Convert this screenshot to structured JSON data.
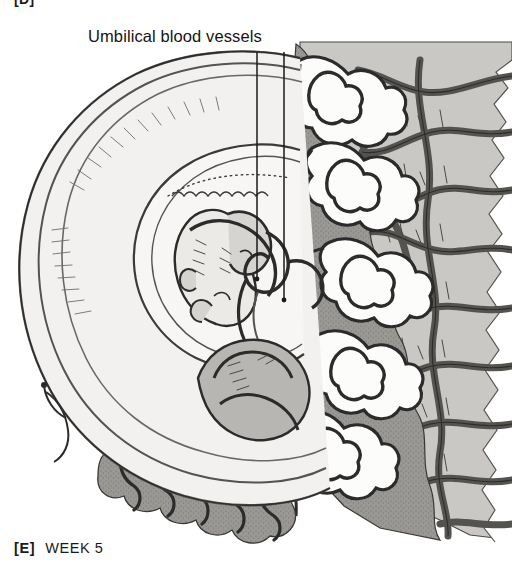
{
  "figure": {
    "panel_tag_top": "[D]",
    "panel_tag_bottom": "[E]",
    "caption_text": "WEEK 5",
    "style": "grayscale-line-illustration"
  },
  "annotations": {
    "umbilical_label": "Umbilical blood vessels",
    "leader_lines": [
      {
        "x": 257,
        "y_top": 52,
        "y_bottom": 279
      },
      {
        "x": 284,
        "y_top": 52,
        "y_bottom": 300
      }
    ]
  },
  "colors": {
    "background": "#ffffff",
    "ink": "#1a1a1a",
    "line_dark": "#2b2b2b",
    "line_mid": "#5d5d5d",
    "fill_light": "#f2f1ef",
    "fill_pale": "#e2e1de",
    "fill_mid_gray": "#c9c8c4",
    "fill_dark_gray": "#9a9894",
    "fill_deep_gray": "#7e7c78",
    "villi_white": "#fcfcfb"
  },
  "structures": [
    {
      "name": "chorionic-sac-outer-wall",
      "region": "left-oval-outline"
    },
    {
      "name": "amniotic-cavity",
      "region": "inner-oval"
    },
    {
      "name": "embryo",
      "region": "center-left"
    },
    {
      "name": "yolk-sac",
      "region": "lower-center"
    },
    {
      "name": "umbilical-cord-stalk",
      "region": "center"
    },
    {
      "name": "chorionic-villi",
      "region": "right-and-bottom"
    },
    {
      "name": "maternal-endometrium",
      "region": "far-right"
    },
    {
      "name": "maternal-blood-vessels",
      "region": "far-right"
    }
  ]
}
